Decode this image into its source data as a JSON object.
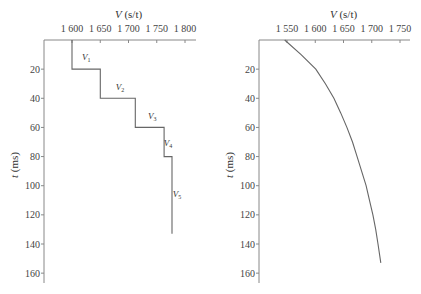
{
  "chart_data": [
    {
      "type": "line",
      "subtype": "step",
      "title": "",
      "xlabel_var": "V",
      "xlabel_unit": "(s/t)",
      "ylabel_var": "t",
      "ylabel_unit": "(ms)",
      "xlim": [
        1550,
        1800
      ],
      "ylim": [
        0,
        165
      ],
      "x_ticks": [
        "1 600",
        "1 650",
        "1 700",
        "1 750",
        "1 800"
      ],
      "x_tick_values": [
        1600,
        1650,
        1700,
        1750,
        1800
      ],
      "y_ticks": [
        "20",
        "40",
        "60",
        "80",
        "100",
        "120",
        "140",
        "160"
      ],
      "y_tick_values": [
        20,
        40,
        60,
        80,
        100,
        120,
        140,
        160
      ],
      "series": [
        {
          "name": "interval velocity",
          "points": [
            [
              1600,
              0
            ],
            [
              1600,
              20
            ],
            [
              1650,
              20
            ],
            [
              1650,
              40
            ],
            [
              1712,
              40
            ],
            [
              1712,
              60
            ],
            [
              1763,
              60
            ],
            [
              1763,
              80
            ],
            [
              1777,
              80
            ],
            [
              1777,
              133
            ]
          ]
        }
      ],
      "annotations": [
        {
          "text": "V",
          "sub": "1",
          "x": 1625,
          "y": 14
        },
        {
          "text": "V",
          "sub": "2",
          "x": 1685,
          "y": 34
        },
        {
          "text": "V",
          "sub": "3",
          "x": 1742,
          "y": 54
        },
        {
          "text": "V",
          "sub": "4",
          "x": 1770,
          "y": 73
        },
        {
          "text": "V",
          "sub": "5",
          "x": 1786,
          "y": 108
        }
      ]
    },
    {
      "type": "line",
      "title": "",
      "xlabel_var": "V",
      "xlabel_unit": "(s/t)",
      "ylabel_var": "t",
      "ylabel_unit": "(ms)",
      "xlim": [
        1500,
        1760
      ],
      "ylim": [
        0,
        165
      ],
      "x_ticks": [
        "1 550",
        "1 600",
        "1 650",
        "1 700",
        "1 750"
      ],
      "x_tick_values": [
        1550,
        1600,
        1650,
        1700,
        1750
      ],
      "y_ticks": [
        "20",
        "40",
        "60",
        "80",
        "100",
        "120",
        "140",
        "160"
      ],
      "y_tick_values": [
        20,
        40,
        60,
        80,
        100,
        120,
        140,
        160
      ],
      "series": [
        {
          "name": "average velocity",
          "points": [
            [
              1546,
              0
            ],
            [
              1575,
              10
            ],
            [
              1601,
              20
            ],
            [
              1618,
              30
            ],
            [
              1633,
              40
            ],
            [
              1645,
              50
            ],
            [
              1656,
              60
            ],
            [
              1666,
              70
            ],
            [
              1674,
              80
            ],
            [
              1682,
              90
            ],
            [
              1690,
              100
            ],
            [
              1696,
              110
            ],
            [
              1702,
              120
            ],
            [
              1707,
              130
            ],
            [
              1711,
              140
            ],
            [
              1716,
              153
            ]
          ]
        }
      ]
    }
  ]
}
